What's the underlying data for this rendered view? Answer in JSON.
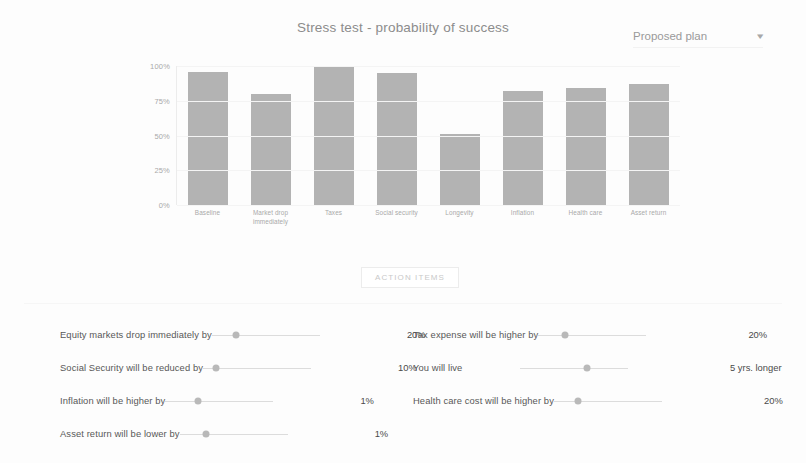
{
  "header": {
    "title": "Stress test - probability of success",
    "plan_select": {
      "value": "Proposed plan",
      "caret_icon": "chevron-down-icon"
    }
  },
  "chart_data": {
    "type": "bar",
    "title": "Stress test - probability of success",
    "xlabel": "",
    "ylabel": "",
    "ylim": [
      0,
      100
    ],
    "grid": true,
    "legend": null,
    "bar_color": "#b3b3b3",
    "ytick_labels": [
      "100%",
      "75%",
      "50%",
      "25%",
      "0%"
    ],
    "ytick_values": [
      100,
      75,
      50,
      25,
      0
    ],
    "categories": [
      "Baseline",
      "Market drop immediately",
      "Taxes",
      "Social security",
      "Longevity",
      "Inflation",
      "Health care",
      "Asset return"
    ],
    "values": [
      96,
      80,
      99,
      95,
      51,
      82,
      84,
      87
    ]
  },
  "action_button": {
    "label": "ACTION ITEMS"
  },
  "sliders": {
    "left_column": [
      {
        "label": "Equity markets drop immediately by",
        "value": "20%",
        "thumb_pct": 22
      },
      {
        "label": "Social Security will be reduced by",
        "value": "10%",
        "thumb_pct": 12
      },
      {
        "label": "Inflation will be higher by",
        "value": "1%",
        "thumb_pct": 30
      },
      {
        "label": "Asset return will be lower by",
        "value": "1%",
        "thumb_pct": 24
      }
    ],
    "right_column": [
      {
        "label": "Tax expense will be higher by",
        "value": "20%",
        "thumb_pct": 25
      },
      {
        "label": "You will live",
        "value": "5 yrs. longer",
        "thumb_pct": 62
      },
      {
        "label": "Health care cost will be higher by",
        "value": "20%",
        "thumb_pct": 22
      }
    ]
  }
}
